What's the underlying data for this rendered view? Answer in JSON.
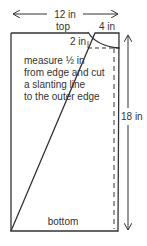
{
  "diagram": {
    "width_label": "12 in",
    "height_label": "18 in",
    "top_label": "top",
    "bottom_label": "bottom",
    "corner_width_label": "4 in",
    "corner_height_label": "2 in",
    "instructions": [
      "measure ½ in",
      "from edge and cut",
      "a slanting line",
      "to the outer edge"
    ],
    "colors": {
      "line": "#333333",
      "background": "#ffffff"
    }
  }
}
